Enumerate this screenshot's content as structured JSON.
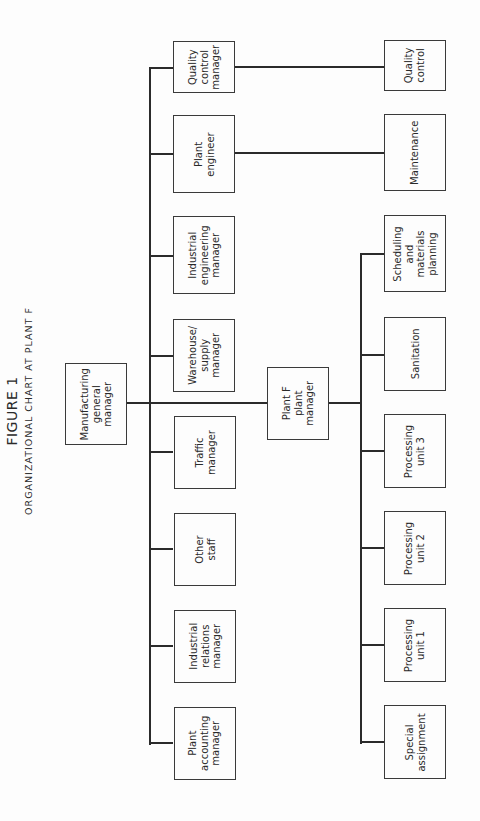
{
  "figure": {
    "label": "FIGURE 1",
    "title": "ORGANIZATIONAL CHART AT PLANT F",
    "orientation": "rotated 90° counter-clockwise"
  },
  "root": {
    "label": "Manufacturing\ngeneral\nmanager"
  },
  "staff": [
    {
      "label": "Quality\ncontrol\nmanager"
    },
    {
      "label": "Plant\nengineer"
    },
    {
      "label": "Industrial\nengineering\nmanager"
    },
    {
      "label": "Warehouse/\nsupply\nmanager"
    },
    {
      "label": "Traffic\nmanager"
    },
    {
      "label": "Other\nstaff"
    },
    {
      "label": "Industrial\nrelations\nmanager"
    },
    {
      "label": "Plant\naccounting\nmanager"
    }
  ],
  "plant_manager": {
    "label": "Plant F\nplant\nmanager"
  },
  "direct_reports": [
    {
      "label": "Quality\ncontrol",
      "reports_to": "Quality control manager"
    },
    {
      "label": "Maintenance",
      "reports_to": "Plant engineer"
    }
  ],
  "plant_units": [
    {
      "label": "Scheduling\nand\nmaterials\nplanning"
    },
    {
      "label": "Sanitation"
    },
    {
      "label": "Processing\nunit 3"
    },
    {
      "label": "Processing\nunit 2"
    },
    {
      "label": "Processing\nunit 1"
    },
    {
      "label": "Special\nassignment"
    }
  ],
  "colors": {
    "line": "#2b2b2b",
    "background": "#fdfdfd",
    "text": "#2a2a2a"
  }
}
